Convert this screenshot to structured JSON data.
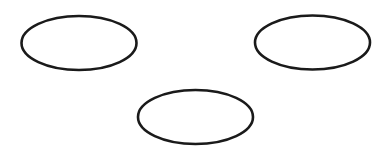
{
  "canvas": {
    "width": 388,
    "height": 153,
    "background": "#ffffff"
  },
  "style": {
    "stroke_color": "#1a1a1a",
    "stroke_width": 2.6,
    "fill_color": "#ffffff"
  },
  "shapes": [
    {
      "id": "ellipse-top-left",
      "type": "ellipse",
      "cx": 79,
      "cy": 43,
      "rx": 57.5,
      "ry": 27,
      "label": ""
    },
    {
      "id": "ellipse-top-right",
      "type": "ellipse",
      "cx": 312.5,
      "cy": 42.5,
      "rx": 57.5,
      "ry": 27,
      "label": ""
    },
    {
      "id": "ellipse-bottom-center",
      "type": "ellipse",
      "cx": 195.5,
      "cy": 117,
      "rx": 57.5,
      "ry": 27,
      "label": ""
    }
  ]
}
